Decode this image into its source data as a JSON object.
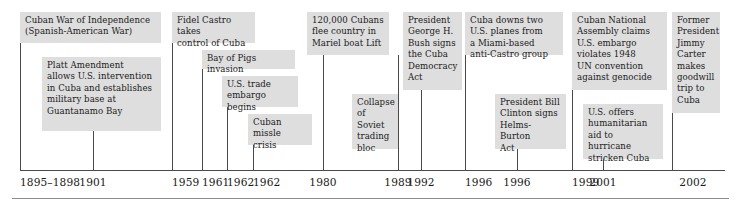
{
  "figure": {
    "kind": "historical-timeline",
    "axis": {
      "line_color": "#4a4a4a",
      "box_fill": "#dedede",
      "text_color": "#1a1a1a"
    }
  },
  "events": [
    {
      "id": "cuban-war-of-independence",
      "text": "Cuban War of Independence\n(Spanish-American War)",
      "date": "1895–1898",
      "row": "upper",
      "box": {
        "x": 20,
        "y": 12,
        "w": 141,
        "h": 31
      },
      "tick": {
        "x": 20,
        "y": 43,
        "h": 127
      },
      "label": {
        "x": 20,
        "align": "left"
      }
    },
    {
      "id": "platt-amendment",
      "text": "Platt Amendment\nallows U.S. intervention\nin Cuba and establishes\nmilitary base at\nGuantanamo Bay",
      "date": "1901",
      "row": "lower",
      "box": {
        "x": 42,
        "y": 57,
        "w": 119,
        "h": 74
      },
      "tick": {
        "x": 93,
        "y": 131,
        "h": 39
      },
      "label": {
        "x": 93,
        "align": "center"
      }
    },
    {
      "id": "fidel-castro-control",
      "text": "Fidel Castro takes\ncontrol of Cuba",
      "date": "1959",
      "row": "upper",
      "box": {
        "x": 172,
        "y": 12,
        "w": 83,
        "h": 31
      },
      "tick": {
        "x": 172,
        "y": 43,
        "h": 127
      },
      "label": {
        "x": 172,
        "align": "left"
      }
    },
    {
      "id": "bay-of-pigs",
      "text": "Bay of Pigs invasion",
      "date": "1961",
      "row": "upper-2",
      "box": {
        "x": 202,
        "y": 50,
        "w": 93,
        "h": 19
      },
      "tick": {
        "x": 202,
        "y": 69,
        "h": 101
      },
      "label": {
        "x": 202,
        "align": "left"
      }
    },
    {
      "id": "us-trade-embargo",
      "text": "U.S. trade\nembargo begins",
      "date": "1962",
      "row": "mid",
      "box": {
        "x": 222,
        "y": 76,
        "w": 76,
        "h": 31
      },
      "tick": {
        "x": 227,
        "y": 107,
        "h": 63
      },
      "label": {
        "x": 227,
        "align": "left"
      }
    },
    {
      "id": "cuban-missle-crisis",
      "text": "Cuban\nmissle crisis",
      "date": "1962",
      "row": "lower",
      "box": {
        "x": 248,
        "y": 114,
        "w": 64,
        "h": 31
      },
      "tick": {
        "x": 253,
        "y": 145,
        "h": 25
      },
      "label": {
        "x": 253,
        "align": "left"
      }
    },
    {
      "id": "mariel-boat-lift",
      "text": "120,000 Cubans\nflee country in\nMariel boat Lift",
      "date": "1980",
      "row": "upper",
      "box": {
        "x": 307,
        "y": 12,
        "w": 82,
        "h": 43
      },
      "tick": {
        "x": 323,
        "y": 55,
        "h": 115
      },
      "label": {
        "x": 323,
        "align": "center"
      }
    },
    {
      "id": "collapse-soviet-bloc",
      "text": "Collapse\nof Soviet\ntrading\nbloc",
      "date": "1989",
      "row": "lower",
      "box": {
        "x": 352,
        "y": 94,
        "w": 46,
        "h": 55
      },
      "tick": {
        "x": 398,
        "y": 55,
        "h": 115
      },
      "label": {
        "x": 398,
        "align": "center"
      }
    },
    {
      "id": "cuba-democracy-act",
      "text": "President\nGeorge H.\nBush signs\nthe Cuba\nDemocracy\nAct",
      "date": "1992",
      "row": "upper",
      "box": {
        "x": 403,
        "y": 12,
        "w": 59,
        "h": 78
      },
      "tick": {
        "x": 421,
        "y": 90,
        "h": 80
      },
      "label": {
        "x": 421,
        "align": "center"
      }
    },
    {
      "id": "cuba-downs-planes",
      "text": "Cuba downs two\nU.S. planes from\na Miami-based\nanti-Castro group",
      "date": "1996",
      "row": "upper",
      "box": {
        "x": 465,
        "y": 12,
        "w": 98,
        "h": 43
      },
      "tick": {
        "x": 465,
        "y": 55,
        "h": 115
      },
      "label": {
        "x": 465,
        "align": "left"
      }
    },
    {
      "id": "helms-burton-act",
      "text": "President Bill\nClinton signs\nHelms-Burton\nAct",
      "date": "1996",
      "row": "lower",
      "box": {
        "x": 495,
        "y": 94,
        "w": 71,
        "h": 55
      },
      "tick": {
        "x": 517,
        "y": 149,
        "h": 21
      },
      "label": {
        "x": 517,
        "align": "center"
      }
    },
    {
      "id": "un-convention-genocide",
      "text": "Cuban National\nAssembly claims\nU.S. embargo\nviolates 1948\nUN convention\nagainst genocide",
      "date": "1999",
      "row": "upper",
      "box": {
        "x": 572,
        "y": 12,
        "w": 95,
        "h": 78
      },
      "tick": {
        "x": 572,
        "y": 90,
        "h": 80
      },
      "label": {
        "x": 572,
        "align": "left"
      }
    },
    {
      "id": "hurricane-aid",
      "text": "U.S. offers\nhumanitarian\naid to hurricane\nstricken Cuba",
      "date": "2001",
      "row": "lower",
      "box": {
        "x": 583,
        "y": 104,
        "w": 80,
        "h": 55
      },
      "tick": {
        "x": 603,
        "y": 159,
        "h": 11
      },
      "label": {
        "x": 603,
        "align": "center"
      }
    },
    {
      "id": "jimmy-carter-trip",
      "text": "Former\nPresident\nJimmy\nCarter\nmakes\ngoodwill\ntrip to\nCuba",
      "date": "2002",
      "row": "upper",
      "box": {
        "x": 672,
        "y": 12,
        "w": 48,
        "h": 101
      },
      "tick": {
        "x": 672,
        "y": 113,
        "h": 57
      },
      "label": {
        "x": 693,
        "align": "center"
      }
    }
  ],
  "axis": {
    "x": 20,
    "y": 170,
    "width": 705
  },
  "bottom_rule": {
    "x": 12,
    "y": 198,
    "width": 717
  }
}
